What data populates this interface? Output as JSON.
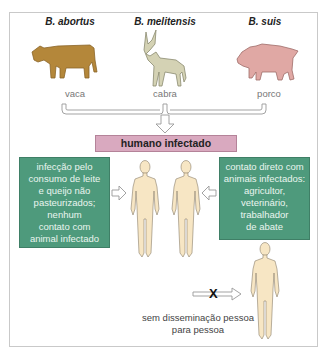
{
  "animals": [
    {
      "species": "B. abortus",
      "label": "vaca",
      "icon": "cow-icon",
      "color": "#b4873a"
    },
    {
      "species": "B. melitensis",
      "label": "cabra",
      "icon": "goat-icon",
      "color": "#d4d2b4"
    },
    {
      "species": "B. suis",
      "label": "porco",
      "icon": "pig-icon",
      "color": "#e0a8a4"
    }
  ],
  "center_box": {
    "label": "humano infectado",
    "color": "#d9a9bf"
  },
  "left_box": {
    "lines": [
      "infecção pelo",
      "consumo de leite",
      "e queijo não",
      "pasteurizados;",
      "nenhum",
      "contato com",
      "animal infectado"
    ],
    "color": "#4e9a7c"
  },
  "right_box": {
    "lines": [
      "contato direto com",
      "animais infectados:",
      "agricultor,",
      "veterinário,",
      "trabalhador",
      "de abate"
    ],
    "color": "#4e9a7c"
  },
  "no_spread": {
    "lines": [
      "sem disseminação pessoa",
      "para pessoa"
    ],
    "blocked_marker": "X"
  },
  "human_figure_color": "#f7e6c4"
}
